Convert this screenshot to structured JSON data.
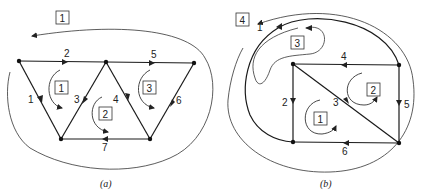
{
  "diagrams": [
    {
      "caption": "(a)",
      "branches": [
        {
          "id": "1",
          "label": "1"
        },
        {
          "id": "2",
          "label": "2"
        },
        {
          "id": "3",
          "label": "3"
        },
        {
          "id": "4",
          "label": "4"
        },
        {
          "id": "5",
          "label": "5"
        },
        {
          "id": "6",
          "label": "6"
        },
        {
          "id": "7",
          "label": "7"
        }
      ],
      "meshes": [
        {
          "id": "1",
          "label": "1",
          "direction": "clockwise"
        },
        {
          "id": "2",
          "label": "2",
          "direction": "clockwise"
        },
        {
          "id": "3",
          "label": "3",
          "direction": "clockwise"
        },
        {
          "id": "outer",
          "label": "1",
          "direction": "counterclockwise"
        }
      ]
    },
    {
      "caption": "(b)",
      "branches": [
        {
          "id": "1",
          "label": "1"
        },
        {
          "id": "2",
          "label": "2"
        },
        {
          "id": "3",
          "label": "3"
        },
        {
          "id": "4",
          "label": "4"
        },
        {
          "id": "5",
          "label": "5"
        },
        {
          "id": "6",
          "label": "6"
        }
      ],
      "meshes": [
        {
          "id": "1",
          "label": "1",
          "direction": "clockwise"
        },
        {
          "id": "2",
          "label": "2",
          "direction": "clockwise"
        },
        {
          "id": "3",
          "label": "3",
          "direction": "counterclockwise"
        },
        {
          "id": "4",
          "label": "4",
          "direction": "counterclockwise"
        }
      ]
    }
  ]
}
